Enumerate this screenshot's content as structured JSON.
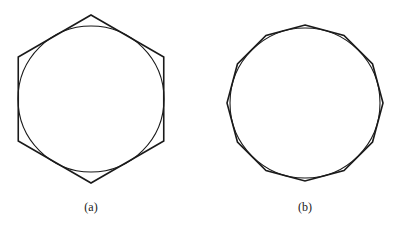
{
  "page": {
    "background_color": "#ffffff",
    "stroke_color": "#1a1a1a",
    "width": 405,
    "height": 229
  },
  "figures": [
    {
      "id": "figure-a",
      "caption": "(a)",
      "description": "regular hexagon circumscribed about a circle",
      "center": {
        "x": 91,
        "y": 99
      },
      "circle": {
        "radius": 73,
        "stroke_color": "#1a1a1a",
        "stroke_width": 1.1
      },
      "polygon": {
        "sides": 6,
        "circumradius": 84,
        "inradius": 73,
        "vertex_angle_offset_deg": -90,
        "stroke_color": "#1a1a1a",
        "stroke_width": 1.6
      }
    },
    {
      "id": "figure-b",
      "caption": "(b)",
      "description": "regular dodecagon circumscribed about a circle",
      "center": {
        "x": 305,
        "y": 103
      },
      "circle": {
        "radius": 75,
        "stroke_color": "#1a1a1a",
        "stroke_width": 1.1
      },
      "polygon": {
        "sides": 12,
        "circumradius": 78,
        "inradius": 75,
        "vertex_angle_offset_deg": -90,
        "stroke_color": "#1a1a1a",
        "stroke_width": 1.6
      }
    }
  ],
  "chart_data": {
    "type": "diagram",
    "title": "",
    "subtitle": "",
    "panels": [
      {
        "label": "(a)",
        "shapes": [
          "circle",
          "regular-polygon"
        ],
        "polygon_sides": 6,
        "relation": "circumscribed",
        "circle_radius_px": 73,
        "polygon_circumradius_px": 84,
        "center_px": [
          91,
          99
        ]
      },
      {
        "label": "(b)",
        "shapes": [
          "circle",
          "regular-polygon"
        ],
        "polygon_sides": 12,
        "relation": "circumscribed",
        "circle_radius_px": 75,
        "polygon_circumradius_px": 78,
        "center_px": [
          305,
          103
        ]
      }
    ]
  }
}
